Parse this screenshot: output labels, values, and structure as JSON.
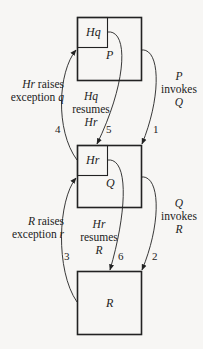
{
  "diagram": {
    "type": "exception-handling-flow",
    "colors": {
      "stroke": "#222222",
      "background": "#f7f6f4"
    },
    "boxes": [
      {
        "id": "P",
        "label": "P",
        "handler": "Hq"
      },
      {
        "id": "Q",
        "label": "Q",
        "handler": "Hr"
      },
      {
        "id": "R",
        "label": "R",
        "handler": null
      }
    ],
    "arrows": [
      {
        "step": "1",
        "from": "P",
        "to": "Q",
        "label_line1": "P",
        "label_line2": "invokes",
        "label_line3": "Q"
      },
      {
        "step": "2",
        "from": "Q",
        "to": "R",
        "label_line1": "Q",
        "label_line2": "invokes",
        "label_line3": "R"
      },
      {
        "step": "3",
        "from": "R",
        "to": "Hr",
        "label_subject": "R",
        "label_verb": " raises",
        "label_line2_text": "exception ",
        "label_line2_var": "r"
      },
      {
        "step": "4",
        "from": "Hr",
        "to": "Hq",
        "label_subject": "Hr",
        "label_verb": " raises",
        "label_line2_text": "exception ",
        "label_line2_var": "q"
      },
      {
        "step": "5",
        "from": "Hq",
        "to": "Hr",
        "label_line1": "Hq",
        "label_line2": "resumes",
        "label_line3": "Hr"
      },
      {
        "step": "6",
        "from": "Hr",
        "to": "R",
        "label_line1": "Hr",
        "label_line2": "resumes",
        "label_line3": "R"
      }
    ]
  }
}
